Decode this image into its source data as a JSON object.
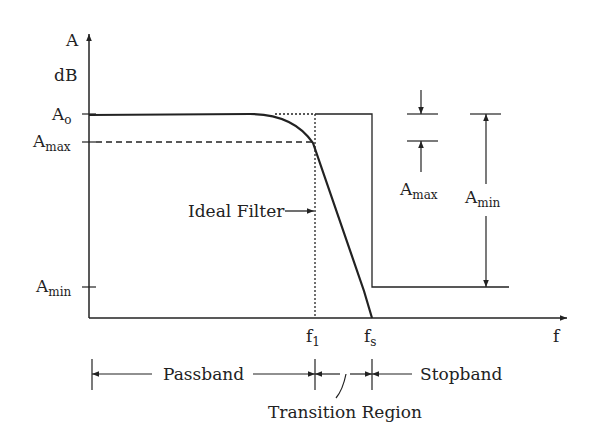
{
  "diagram": {
    "y_axis": {
      "label": "A",
      "unit": "dB"
    },
    "x_axis": {
      "label": "f"
    },
    "y_ticks": [
      {
        "main": "A",
        "sub": "o"
      },
      {
        "main": "A",
        "sub": "max"
      },
      {
        "main": "A",
        "sub": "min"
      }
    ],
    "x_ticks": [
      {
        "main": "f",
        "sub": "1"
      },
      {
        "main": "f",
        "sub": "s"
      }
    ],
    "annotations": {
      "ideal_filter": "Ideal Filter",
      "amax_marker": {
        "main": "A",
        "sub": "max"
      },
      "amin_marker": {
        "main": "A",
        "sub": "min"
      }
    },
    "bands": {
      "passband": "Passband",
      "stopband": "Stopband",
      "transition": "Transition Region"
    },
    "colors": {
      "ink": "#222222",
      "background": "#ffffff"
    }
  }
}
